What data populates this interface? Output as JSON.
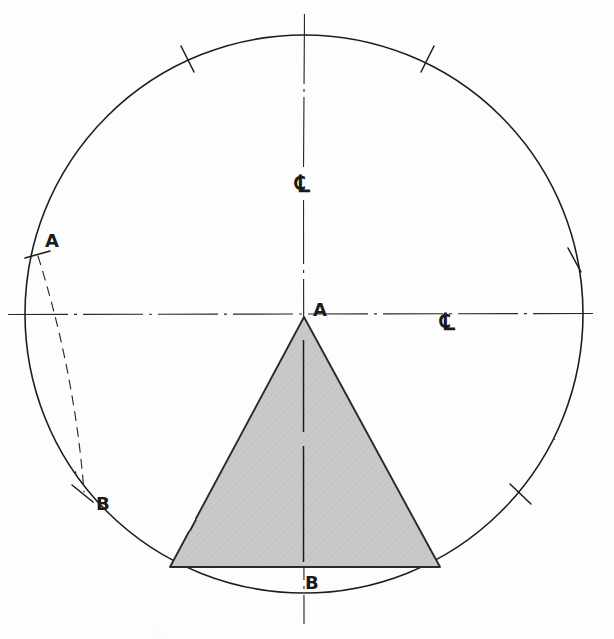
{
  "drawing": {
    "title": "Hand-drawn circle with inscribed shaded triangle",
    "medium": "pencil sketch on white paper",
    "background_color": "#fefefe",
    "ink_color": "#1a1a1a",
    "shade_fill_color": "#c9c9c9",
    "shade_stroke_color": "#2b2b2b"
  },
  "labels": {
    "arc_point_a": "A",
    "arc_point_b": "B",
    "apex_a": "A",
    "base_b": "B",
    "centerline_vertical": "℄",
    "centerline_horizontal": "℄"
  },
  "caption": {
    "text": "Fig. 1"
  },
  "chart_data": {
    "type": "diagram",
    "units": "pixels",
    "circle": {
      "center_x": 304,
      "center_y": 314,
      "radius": 279,
      "stroke_width": 1.6
    },
    "centerlines": [
      {
        "name": "vertical-centerline",
        "orientation": "vertical",
        "x": 304,
        "from_y": 14,
        "to_y": 624,
        "style": "dash-dot",
        "label": "℄",
        "label_x": 303,
        "label_y": 185
      },
      {
        "name": "horizontal-centerline",
        "orientation": "horizontal",
        "y": 314,
        "from_x": 8,
        "to_x": 598,
        "style": "dash-dot",
        "label": "℄",
        "label_x": 450,
        "label_y": 322
      }
    ],
    "tick_marks": [
      {
        "name": "tick-upper-left",
        "x": 188,
        "y": 57,
        "angle_deg": 245
      },
      {
        "name": "tick-upper-right",
        "x": 427,
        "y": 57,
        "angle_deg": 295
      },
      {
        "name": "tick-right",
        "x": 575,
        "y": 259,
        "angle_deg": 350
      },
      {
        "name": "tick-lower-right",
        "x": 520,
        "y": 494,
        "angle_deg": 40
      },
      {
        "name": "tick-point-a",
        "x": 36,
        "y": 255,
        "angle_deg": 192,
        "label": "A"
      },
      {
        "name": "tick-point-b",
        "x": 83,
        "y": 494,
        "angle_deg": 140,
        "label": "B"
      }
    ],
    "arc_labels": [
      {
        "text": "A",
        "x": 52,
        "y": 243
      },
      {
        "text": "B",
        "x": 101,
        "y": 506
      }
    ],
    "chord_dashed": {
      "name": "chord-a-to-b",
      "from_x": 38,
      "from_y": 256,
      "to_x": 84,
      "to_y": 492,
      "style": "dashed",
      "bulge": 14
    },
    "triangle": {
      "name": "shaded-triangle",
      "apex_x": 304,
      "apex_y": 317,
      "base_left_x": 170,
      "base_left_y": 567,
      "base_right_x": 440,
      "base_right_y": 567,
      "fill": "#c9c9c9",
      "stroke": "#2b2b2b",
      "apex_label": "A",
      "apex_label_x": 320,
      "apex_label_y": 313,
      "base_label": "B",
      "base_label_x": 313,
      "base_label_y": 584
    }
  }
}
